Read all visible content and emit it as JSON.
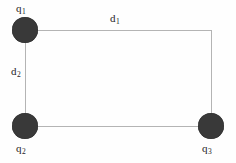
{
  "figure": {
    "kind": "physics-point-charge-diagram",
    "background_color": "#fefefe",
    "node_color": "#393939",
    "edge_color": "#b4b4b4",
    "text_color": "#1d1d1d",
    "charges": [
      {
        "id": "q1",
        "base": "q",
        "sub": "1",
        "label": "q₁",
        "position": "top-left",
        "cx": 25,
        "cy": 30,
        "r": 13
      },
      {
        "id": "q2",
        "base": "q",
        "sub": "2",
        "label": "q₂",
        "position": "bottom-left",
        "cx": 25,
        "cy": 126,
        "r": 13
      },
      {
        "id": "q3",
        "base": "q",
        "sub": "3",
        "label": "q₃",
        "position": "bottom-right",
        "cx": 211,
        "cy": 126,
        "r": 13
      }
    ],
    "distances": [
      {
        "id": "d1",
        "base": "d",
        "sub": "1",
        "label": "d₁",
        "between": "q1-to-top-right",
        "orientation": "horizontal"
      },
      {
        "id": "d2",
        "base": "d",
        "sub": "2",
        "label": "d₂",
        "between": "q1-to-q2",
        "orientation": "vertical"
      }
    ],
    "edges": [
      {
        "id": "top",
        "from": "q1",
        "to": "top-right",
        "orientation": "horizontal"
      },
      {
        "id": "right",
        "from": "top-right",
        "to": "q3",
        "orientation": "vertical"
      },
      {
        "id": "bottom",
        "from": "q2",
        "to": "q3",
        "orientation": "horizontal"
      },
      {
        "id": "left",
        "from": "q1",
        "to": "q2",
        "orientation": "vertical"
      }
    ]
  }
}
